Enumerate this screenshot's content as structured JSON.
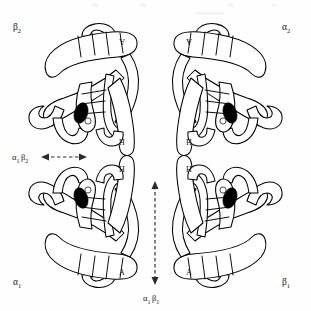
{
  "figure": {
    "background_color": "#fefefe",
    "stroke_color": "#000000",
    "heme_color": "#000000",
    "arrow_color": "#2a2a2a",
    "width": 311,
    "height": 311
  },
  "subunits": [
    {
      "id": "beta2",
      "position": "top-left",
      "label": "β",
      "label_subscript": "2",
      "helix_a_label": "A",
      "helix_h_label": "H",
      "heme": "heme-group"
    },
    {
      "id": "alpha2",
      "position": "top-right",
      "label": "α",
      "label_subscript": "2",
      "helix_a_label": "A",
      "helix_h_label": "H",
      "heme": "heme-group"
    },
    {
      "id": "alpha1",
      "position": "bottom-left",
      "label": "α",
      "label_subscript": "1",
      "helix_a_label": "A",
      "helix_h_label": "H",
      "heme": "heme-group"
    },
    {
      "id": "beta1",
      "position": "bottom-right",
      "label": "β",
      "label_subscript": "1",
      "helix_a_label": "A",
      "helix_h_label": "H",
      "heme": "heme-group"
    }
  ],
  "interfaces": [
    {
      "id": "alpha1beta2",
      "label_alpha": "α",
      "label_alpha_sub": "1",
      "label_beta": "β",
      "label_beta_sub": "2",
      "orientation": "horizontal",
      "arrow": "double-headed-dashed"
    },
    {
      "id": "alpha1beta1",
      "label_alpha": "α",
      "label_alpha_sub": "1",
      "label_beta": "β",
      "label_beta_sub": "1",
      "orientation": "vertical",
      "arrow": "double-headed-dashed"
    }
  ]
}
